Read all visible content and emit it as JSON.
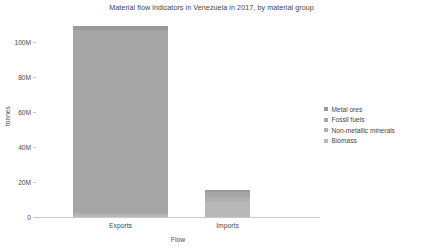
{
  "chart_data": {
    "type": "bar",
    "stacked": true,
    "title": "Material flow indicators in Venezuela in 2017, by material group",
    "xlabel": "Flow",
    "ylabel": "tonnes",
    "categories": [
      "Exports",
      "Imports"
    ],
    "ylim": [
      0,
      112000000
    ],
    "yticks": [
      0,
      20000000,
      40000000,
      60000000,
      80000000,
      100000000
    ],
    "ytick_labels": [
      "0",
      "20M",
      "40M",
      "60M",
      "80M",
      "100M"
    ],
    "grid": false,
    "legend_position": "right",
    "series": [
      {
        "name": "Metal ores",
        "color": "#9a9a9a",
        "values": [
          2500000,
          1200000
        ]
      },
      {
        "name": "Fossil fuels",
        "color": "#a5a5a5",
        "values": [
          104500000,
          3000000
        ]
      },
      {
        "name": "Non-metallic minerals",
        "color": "#b0b0b0",
        "values": [
          1000000,
          2600000
        ]
      },
      {
        "name": "Biomass",
        "color": "#b8b8b8",
        "values": [
          1200000,
          8600000
        ]
      }
    ],
    "totals": [
      109200000,
      15400000
    ]
  },
  "legend": {
    "items": [
      {
        "label": "Metal ores",
        "color": "#9a9a9a"
      },
      {
        "label": "Fossil fuels",
        "color": "#a5a5a5"
      },
      {
        "label": "Non-metallic minerals",
        "color": "#b0b0b0"
      },
      {
        "label": "Biomass",
        "color": "#b8b8b8"
      }
    ]
  },
  "axes": {
    "y_title": "tonnes",
    "x_title": "Flow",
    "y_labels": [
      "100M",
      "80M",
      "60M",
      "40M",
      "20M",
      "0"
    ],
    "x_labels": [
      "Exports",
      "Imports"
    ]
  }
}
